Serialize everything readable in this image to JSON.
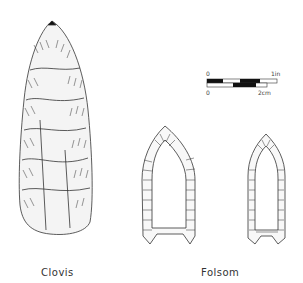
{
  "figure": {
    "labels": {
      "clovis": "Clovis",
      "folsom": "Folsom"
    },
    "scale_bar": {
      "top_start": "0",
      "top_end": "1in",
      "bottom_start": "0",
      "bottom_end": "2cm"
    },
    "colors": {
      "ink": "#222222",
      "background": "#ffffff"
    }
  }
}
